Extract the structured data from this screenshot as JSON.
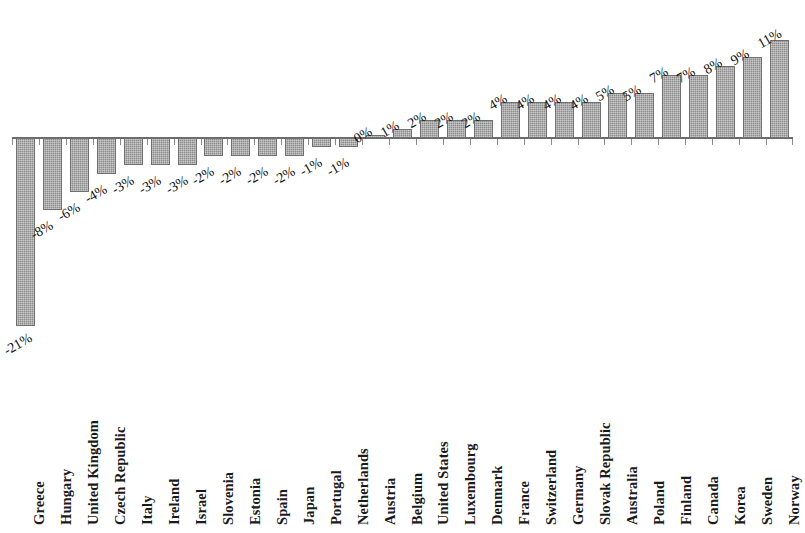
{
  "chart": {
    "title": "",
    "subtitle": "",
    "background_color": "#ffffff",
    "bar_color": "#8c8c8c",
    "bar_border_color": "#6f6f6f",
    "axis_color": "#6b6b6b",
    "label_rotation_deg": -30,
    "category_rotation_deg": -90
  },
  "chart_data": {
    "type": "bar",
    "title": "",
    "xlabel": "",
    "ylabel": "",
    "ylim": [
      -22,
      12
    ],
    "grid": false,
    "legend": false,
    "value_label_suffix": "%",
    "categories": [
      "Greece",
      "Hungary",
      "United Kingdom",
      "Czech Republic",
      "Italy",
      "Ireland",
      "Israel",
      "Slovenia",
      "Estonia",
      "Spain",
      "Japan",
      "Portugal",
      "Netherlands",
      "Austria",
      "Belgium",
      "United States",
      "Luxembourg",
      "Denmark",
      "France",
      "Switzerland",
      "Germany",
      "Slovak Republic",
      "Australia",
      "Poland",
      "Finland",
      "Canada",
      "Korea",
      "Sweden",
      "Norway"
    ],
    "values": [
      -21,
      -8,
      -6,
      -4,
      -3,
      -3,
      -3,
      -2,
      -2,
      -2,
      -2,
      -1,
      -1,
      0,
      1,
      2,
      2,
      2,
      4,
      4,
      4,
      4,
      5,
      5,
      7,
      7,
      8,
      9,
      11
    ],
    "value_labels": [
      "-21%",
      "-8%",
      "-6%",
      "-4%",
      "-3%",
      "-3%",
      "-3%",
      "-2%",
      "-2%",
      "-2%",
      "-2%",
      "-1%",
      "-1%",
      "0%",
      "1%",
      "2%",
      "2%",
      "2%",
      "4%",
      "4%",
      "4%",
      "4%",
      "5%",
      "5%",
      "7%",
      "7%",
      "8%",
      "9%",
      "11%"
    ]
  }
}
